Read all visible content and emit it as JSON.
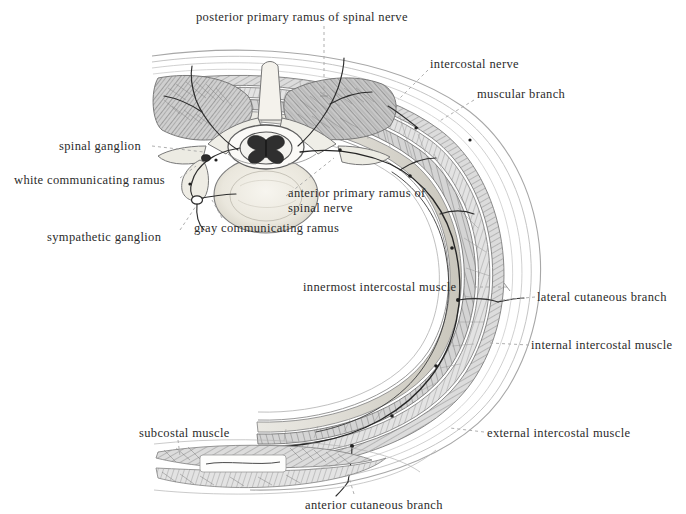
{
  "figure": {
    "background_color": "#ffffff",
    "ink_color": "#3a3a3a",
    "text_color": "#2b2b2b",
    "leader_color": "#9a9a9a",
    "width": 686,
    "height": 514
  },
  "labels": {
    "posterior_primary_ramus": "posterior primary  ramus of spinal nerve",
    "intercostal_nerve": "intercostal nerve",
    "muscular_branch": "muscular branch",
    "spinal_ganglion": "spinal ganglion",
    "white_communicating_ramus": "white communicating ramus",
    "anterior_primary_ramus_line1": "anterior primary ramus of",
    "anterior_primary_ramus_line2": "spinal nerve",
    "sympathetic_ganglion": "sympathetic ganglion",
    "gray_communicating_ramus": "gray  communicating ramus",
    "innermost_intercostal_muscle": "innermost intercostal muscle",
    "lateral_cutaneous_branch": "lateral cutaneous branch",
    "internal_intercostal_muscle": "internal intercostal muscle",
    "subcostal_muscle": "subcostal muscle",
    "external_intercostal_muscle": "external intercostal muscle",
    "anterior_cutaneous_branch": "anterior cutaneous branch"
  },
  "leader_dashes": {
    "spinal_ganglion": "---------",
    "innermost": "- - -",
    "lateral_cutaneous": "- -",
    "internal_intercostal": "- -",
    "external_intercostal": "- - - -"
  }
}
